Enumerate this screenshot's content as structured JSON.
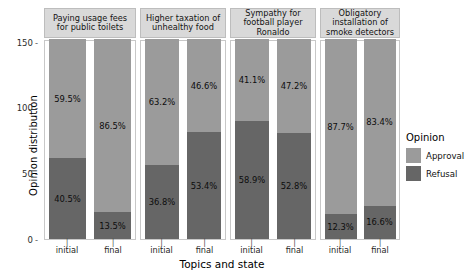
{
  "chart_data": {
    "type": "bar",
    "subtype": "stacked-percent-faceted",
    "title": "",
    "xlabel": "Topics and state",
    "ylabel": "Opinion distribution",
    "ylim": [
      0,
      152
    ],
    "yticks": [
      0,
      50,
      100,
      150
    ],
    "ytick_labels": [
      "0",
      "50",
      "100",
      "150"
    ],
    "grid": false,
    "legend": {
      "title": "Opinion",
      "position": "right",
      "entries": [
        {
          "name": "Approval",
          "color": "#9b9b9b"
        },
        {
          "name": "Refusal",
          "color": "#666666"
        }
      ]
    },
    "categories": [
      "initial",
      "final"
    ],
    "series": [
      {
        "name": "Approval",
        "color": "#9b9b9b"
      },
      {
        "name": "Refusal",
        "color": "#666666"
      }
    ],
    "panels": [
      {
        "facet": "Paying usage fees for public toilets",
        "bars": [
          {
            "state": "initial",
            "approval_pct": "59.5%",
            "refusal_pct": "40.5%",
            "approval": 59.5,
            "refusal": 40.5,
            "total": 152
          },
          {
            "state": "final",
            "approval_pct": "86.5%",
            "refusal_pct": "13.5%",
            "approval": 86.5,
            "refusal": 13.5,
            "total": 152
          }
        ]
      },
      {
        "facet": "Higher taxation of unhealthy food",
        "bars": [
          {
            "state": "initial",
            "approval_pct": "63.2%",
            "refusal_pct": "36.8%",
            "approval": 63.2,
            "refusal": 36.8,
            "total": 152
          },
          {
            "state": "final",
            "approval_pct": "46.6%",
            "refusal_pct": "53.4%",
            "approval": 46.6,
            "refusal": 53.4,
            "total": 152
          }
        ]
      },
      {
        "facet": "Sympathy for football player Ronaldo",
        "bars": [
          {
            "state": "initial",
            "approval_pct": "41.1%",
            "refusal_pct": "58.9%",
            "approval": 41.1,
            "refusal": 58.9,
            "total": 152
          },
          {
            "state": "final",
            "approval_pct": "47.2%",
            "refusal_pct": "52.8%",
            "approval": 47.2,
            "refusal": 52.8,
            "total": 152
          }
        ]
      },
      {
        "facet": "Obligatory installation of smoke detectors",
        "bars": [
          {
            "state": "initial",
            "approval_pct": "87.7%",
            "refusal_pct": "12.3%",
            "approval": 87.7,
            "refusal": 12.3,
            "total": 152
          },
          {
            "state": "final",
            "approval_pct": "83.4%",
            "refusal_pct": "16.6%",
            "approval": 83.4,
            "refusal": 16.6,
            "total": 152
          }
        ]
      }
    ]
  },
  "axes": {
    "y_title": "Opinion distribution",
    "x_title": "Topics and state",
    "y_ticks": [
      "150",
      "100",
      "50",
      "0"
    ],
    "tick_mark": "-"
  },
  "panel_titles": [
    "Paying usage fees for public toilets",
    "Higher taxation of unhealthy food",
    "Sympathy for football player Ronaldo",
    "Obligatory installation of smoke detectors"
  ],
  "legend": {
    "title": "Opinion",
    "approval_label": "Approval",
    "refusal_label": "Refusal"
  },
  "colors": {
    "approval": "#9b9b9b",
    "refusal": "#666666",
    "strip": "#d9d9d9",
    "background": "#ffffff"
  }
}
